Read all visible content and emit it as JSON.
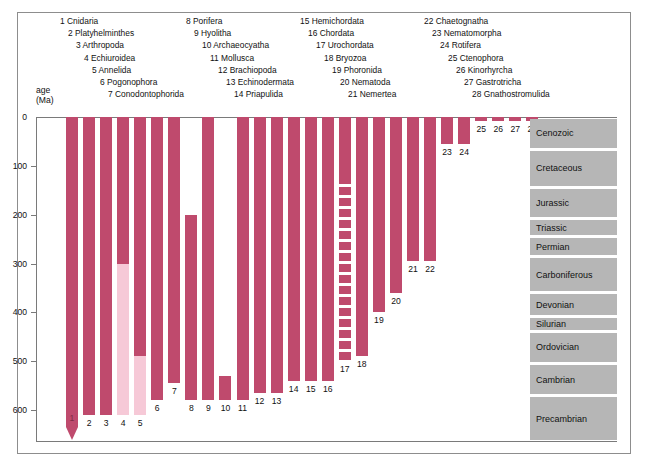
{
  "figure": {
    "axis_title_line1": "age",
    "axis_title_line2": "(Ma)"
  },
  "legend": {
    "columns": [
      {
        "items": [
          {
            "num": "1",
            "name": "Cnidaria"
          },
          {
            "num": "2",
            "name": "Platyhelminthes"
          },
          {
            "num": "3",
            "name": "Arthropoda"
          },
          {
            "num": "4",
            "name": "Echiuroidea"
          },
          {
            "num": "5",
            "name": "Annelida"
          },
          {
            "num": "6",
            "name": "Pogonophora"
          },
          {
            "num": "7",
            "name": "Conodontophorida"
          }
        ]
      },
      {
        "items": [
          {
            "num": "8",
            "name": "Porifera"
          },
          {
            "num": "9",
            "name": "Hyolitha"
          },
          {
            "num": "10",
            "name": "Archaeocyatha"
          },
          {
            "num": "11",
            "name": "Mollusca"
          },
          {
            "num": "12",
            "name": "Brachiopoda"
          },
          {
            "num": "13",
            "name": "Echinodermata"
          },
          {
            "num": "14",
            "name": "Priapulida"
          }
        ]
      },
      {
        "items": [
          {
            "num": "15",
            "name": "Hemichordata"
          },
          {
            "num": "16",
            "name": "Chordata"
          },
          {
            "num": "17",
            "name": "Urochordata"
          },
          {
            "num": "18",
            "name": "Bryozoa"
          },
          {
            "num": "19",
            "name": "Phoronida"
          },
          {
            "num": "20",
            "name": "Nematoda"
          },
          {
            "num": "21",
            "name": "Nemertea"
          }
        ]
      },
      {
        "items": [
          {
            "num": "22",
            "name": "Chaetognatha"
          },
          {
            "num": "23",
            "name": "Nematomorpha"
          },
          {
            "num": "24",
            "name": "Rotifera"
          },
          {
            "num": "25",
            "name": "Ctenophora"
          },
          {
            "num": "26",
            "name": "Kinorhyrcha"
          },
          {
            "num": "27",
            "name": "Gastrotricha"
          },
          {
            "num": "28",
            "name": "Gnathostromulida"
          }
        ]
      }
    ]
  },
  "chart_data": {
    "type": "bar",
    "orientation": "vertical-ranges",
    "title": "",
    "xlabel": "",
    "ylabel": "age (Ma)",
    "ylim": [
      0,
      665
    ],
    "y_inverted": true,
    "grid": false,
    "axis_ticks": [
      "0",
      "100",
      "200",
      "300",
      "400",
      "500",
      "600"
    ],
    "tick_values": [
      0,
      100,
      200,
      300,
      400,
      500,
      600
    ],
    "colors": {
      "solid_range": "#bf4a6d",
      "inferred_range": "#f6c9d7",
      "period_band": "#b6b6b6",
      "frame": "#8d8d8d"
    },
    "legend_note": "Numbers 1-28 identify animal phyla; bar spans fossil record range in millions of years",
    "categories": [
      "Cnidaria",
      "Platyhelminthes",
      "Arthropoda",
      "Echiuroidea",
      "Annelida",
      "Pogonophora",
      "Conodontophorida",
      "Porifera",
      "Hyolitha",
      "Archaeocyatha",
      "Mollusca",
      "Brachiopoda",
      "Echinodermata",
      "Priapulida",
      "Hemichordata",
      "Chordata",
      "Urochordata",
      "Bryozoa",
      "Phoronida",
      "Nematoda",
      "Nemertea",
      "Chaetognatha",
      "Nematomorpha",
      "Rotifera",
      "Ctenophora",
      "Kinorhyrcha",
      "Gastrotricha",
      "Gnathostromulida"
    ],
    "bars": [
      {
        "num": "1",
        "name": "Cnidaria",
        "from": 0,
        "to": 635,
        "style": "solid",
        "tip": true,
        "label": "1"
      },
      {
        "num": "2",
        "name": "Platyhelminthes",
        "from": 0,
        "to": 610,
        "style": "solid",
        "label": "2"
      },
      {
        "num": "3",
        "name": "Arthropoda",
        "from": 0,
        "to": 610,
        "style": "solid",
        "label": "3"
      },
      {
        "num": "4",
        "name": "Echiuroidea",
        "from": 0,
        "to": 610,
        "style": "split",
        "split_at": 300,
        "label": "4"
      },
      {
        "num": "5",
        "name": "Annelida",
        "from": 0,
        "to": 610,
        "style": "split",
        "split_at": 490,
        "label": "5"
      },
      {
        "num": "6",
        "name": "Pogonophora",
        "from": 0,
        "to": 580,
        "style": "solid",
        "label": "6"
      },
      {
        "num": "7",
        "name": "Conodontophorida",
        "from": 0,
        "to": 545,
        "style": "solid",
        "label": "7"
      },
      {
        "num": "8",
        "name": "Porifera",
        "from": 200,
        "to": 580,
        "style": "solid",
        "label": "8"
      },
      {
        "num": "9",
        "name": "Hyolitha",
        "from": 0,
        "to": 580,
        "style": "solid",
        "label": "9"
      },
      {
        "num": "10",
        "name": "Archaeocyatha",
        "from": 530,
        "to": 580,
        "style": "solid",
        "label": "10"
      },
      {
        "num": "11",
        "name": "Mollusca",
        "from": 0,
        "to": 580,
        "style": "solid",
        "label": "11"
      },
      {
        "num": "12",
        "name": "Brachiopoda",
        "from": 0,
        "to": 565,
        "style": "solid",
        "label": "12"
      },
      {
        "num": "13",
        "name": "Echinodermata",
        "from": 0,
        "to": 565,
        "style": "solid",
        "label": "13"
      },
      {
        "num": "14",
        "name": "Priapulida",
        "from": 0,
        "to": 540,
        "style": "solid",
        "label": "14"
      },
      {
        "num": "15",
        "name": "Hemichordata",
        "from": 0,
        "to": 540,
        "style": "solid",
        "label": "15"
      },
      {
        "num": "16",
        "name": "Chordata",
        "from": 0,
        "to": 540,
        "style": "solid",
        "label": "16"
      },
      {
        "num": "17",
        "name": "Urochordata",
        "from": 0,
        "to": 500,
        "style": "dashed",
        "solid_to": 120,
        "label": "17"
      },
      {
        "num": "18",
        "name": "Bryozoa",
        "from": 0,
        "to": 490,
        "style": "solid",
        "label": "18"
      },
      {
        "num": "19",
        "name": "Phoronida",
        "from": 0,
        "to": 400,
        "style": "solid",
        "label": "19"
      },
      {
        "num": "20",
        "name": "Nematoda",
        "from": 0,
        "to": 360,
        "style": "solid",
        "label": "20"
      },
      {
        "num": "21",
        "name": "Nemertea",
        "from": 0,
        "to": 295,
        "style": "solid",
        "label": "21"
      },
      {
        "num": "22",
        "name": "Chaetognatha",
        "from": 0,
        "to": 295,
        "style": "solid",
        "label": "22"
      },
      {
        "num": "23",
        "name": "Nematomorpha",
        "from": 0,
        "to": 55,
        "style": "solid",
        "label": "23"
      },
      {
        "num": "24",
        "name": "Rotifera",
        "from": 0,
        "to": 55,
        "style": "solid",
        "label": "24"
      },
      {
        "num": "25",
        "name": "Ctenophora",
        "from": 0,
        "to": 8,
        "style": "solid",
        "label": "25"
      },
      {
        "num": "26",
        "name": "Kinorhyrcha",
        "from": 0,
        "to": 8,
        "style": "solid",
        "label": "26"
      },
      {
        "num": "27",
        "name": "Gastrotricha",
        "from": 0,
        "to": 8,
        "style": "solid",
        "label": "27"
      },
      {
        "num": "28",
        "name": "Gnathostromulida",
        "from": 0,
        "to": 8,
        "style": "solid",
        "label": "28"
      }
    ],
    "periods": [
      {
        "name": "Cenozoic",
        "from": 0,
        "to": 66
      },
      {
        "name": "Cretaceous",
        "from": 66,
        "to": 144
      },
      {
        "name": "Jurassic",
        "from": 144,
        "to": 208
      },
      {
        "name": "Triassic",
        "from": 208,
        "to": 245
      },
      {
        "name": "Permian",
        "from": 245,
        "to": 286
      },
      {
        "name": "Carboniferous",
        "from": 286,
        "to": 360
      },
      {
        "name": "Devonian",
        "from": 360,
        "to": 408
      },
      {
        "name": "Silurian",
        "from": 408,
        "to": 438
      },
      {
        "name": "Ordovician",
        "from": 438,
        "to": 505
      },
      {
        "name": "Cambrian",
        "from": 505,
        "to": 570
      },
      {
        "name": "Precambrian",
        "from": 570,
        "to": 665
      }
    ]
  }
}
